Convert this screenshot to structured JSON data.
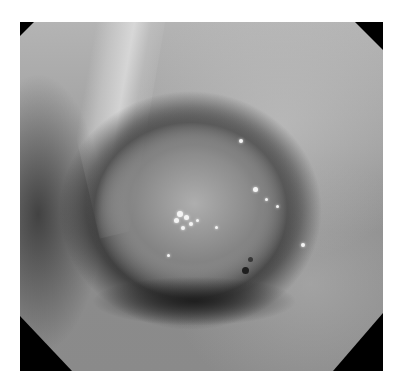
{
  "image": {
    "kind": "grayscale endoscopic photograph",
    "description": "Endoscopic view showing a rounded mucosal lesion/polyp with scattered bright specular highlights, surrounded by a darker ring; octagonal viewport with black clipped corners",
    "caption": ""
  },
  "colors": {
    "background": "#ffffff",
    "viewport_corners": "#000000",
    "tissue_mid": "#9a9a9a",
    "highlight": "#f4f4f4"
  },
  "highlights": [
    {
      "x": 44,
      "y": 55,
      "r": 3
    },
    {
      "x": 46,
      "y": 56,
      "r": 2.5
    },
    {
      "x": 43,
      "y": 57,
      "r": 2.5
    },
    {
      "x": 47,
      "y": 58,
      "r": 2
    },
    {
      "x": 45,
      "y": 59,
      "r": 2
    },
    {
      "x": 49,
      "y": 57,
      "r": 1.5
    },
    {
      "x": 54,
      "y": 59,
      "r": 1.5
    },
    {
      "x": 61,
      "y": 34,
      "r": 2
    },
    {
      "x": 65,
      "y": 48,
      "r": 2.5
    },
    {
      "x": 68,
      "y": 51,
      "r": 1.5
    },
    {
      "x": 71,
      "y": 53,
      "r": 1.5
    },
    {
      "x": 78,
      "y": 64,
      "r": 2
    },
    {
      "x": 41,
      "y": 67,
      "r": 1.5
    }
  ]
}
